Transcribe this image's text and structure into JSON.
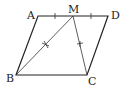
{
  "diagram": {
    "type": "parallelogram",
    "points": {
      "A": {
        "label": "A",
        "x": 38,
        "y": 16
      },
      "M": {
        "label": "M",
        "x": 73,
        "y": 16
      },
      "D": {
        "label": "D",
        "x": 108,
        "y": 16
      },
      "B": {
        "label": "B",
        "x": 16,
        "y": 75
      },
      "C": {
        "label": "C",
        "x": 87,
        "y": 75
      }
    },
    "segments": [
      "AB",
      "BC",
      "CD",
      "DA",
      "MB",
      "MC"
    ],
    "equal_marks": {
      "single_tick": [
        "AM",
        "MD"
      ],
      "cross_tick": [
        "MB",
        "MC"
      ]
    }
  }
}
